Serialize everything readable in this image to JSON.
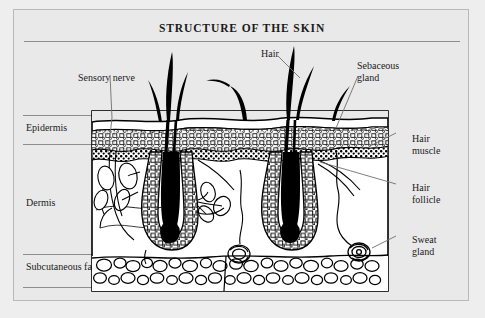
{
  "plate": {
    "title": "STRUCTURE OF THE SKIN",
    "background_color": "#e9e9e9",
    "frame_color": "#b9b9b9",
    "rule_color": "#8d8d8d",
    "ink_color": "#000000"
  },
  "layers": [
    {
      "label": "Epidermis",
      "name": "epidermis"
    },
    {
      "label": "Dermis",
      "name": "dermis"
    },
    {
      "label": "Subcutaneous\nfat",
      "name": "subcutaneous-fat"
    }
  ],
  "callouts": [
    {
      "label": "Sensory nerve",
      "name": "sensory-nerve"
    },
    {
      "label": "Hair",
      "name": "hair"
    },
    {
      "label": "Sebaceous\ngland",
      "name": "sebaceous-gland"
    },
    {
      "label": "Hair\nmuscle",
      "name": "hair-muscle"
    },
    {
      "label": "Hair\nfollicle",
      "name": "hair-follicle"
    },
    {
      "label": "Sweat\ngland",
      "name": "sweat-gland"
    }
  ],
  "diagram": {
    "name": "skin-cross-section",
    "box": {
      "x": 92,
      "y": 111,
      "width": 296,
      "height": 180
    },
    "regions": [
      {
        "name": "skin-surface",
        "description": "wavy outer surface line"
      },
      {
        "name": "epidermis-band",
        "description": "granular cell layer"
      },
      {
        "name": "dermis-band",
        "description": "connective tissue with follicles and nerves"
      },
      {
        "name": "subcutaneous-fat-band",
        "description": "rounded fat cell blobs"
      }
    ],
    "structures": [
      {
        "name": "hair-shaft",
        "count": 7
      },
      {
        "name": "hair-follicle",
        "count": 2
      },
      {
        "name": "sebaceous-gland",
        "count": 4
      },
      {
        "name": "sweat-gland",
        "count": 3
      },
      {
        "name": "sensory-nerve",
        "count": 1
      }
    ]
  }
}
